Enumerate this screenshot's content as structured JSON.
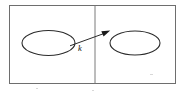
{
  "figure": {
    "type": "diagram",
    "canvas": {
      "width": 182,
      "height": 97
    },
    "frame": {
      "name": "outer-frame",
      "x": 9.5,
      "y": 5.5,
      "width": 166,
      "height": 78,
      "stroke": "#6e6e6e"
    },
    "divider": {
      "name": "panel-divider",
      "x": 95,
      "y1": 5.5,
      "y2": 83.5,
      "stroke": "#7a7a7a"
    },
    "panels": [
      {
        "id": "left-panel",
        "label": "",
        "ellipse": {
          "id": "left-ellipse",
          "cx": 48.5,
          "cy": 43,
          "rx": 26.5,
          "ry": 12.5,
          "stroke": "#2b2b2b"
        }
      },
      {
        "id": "right-panel",
        "label": "",
        "ellipse": {
          "id": "right-ellipse",
          "cx": 135,
          "cy": 43,
          "rx": 25,
          "ry": 12,
          "stroke": "#2b2b2b"
        }
      }
    ],
    "arrow": {
      "id": "mapping-arrow",
      "label": "k",
      "label_x": 78,
      "label_y": 51,
      "from": {
        "x": 70,
        "y": 45.5
      },
      "to": {
        "x": 108.5,
        "y": 31.5
      },
      "stroke": "#2b2b2b",
      "head_fill": "#1a1a1a"
    }
  }
}
